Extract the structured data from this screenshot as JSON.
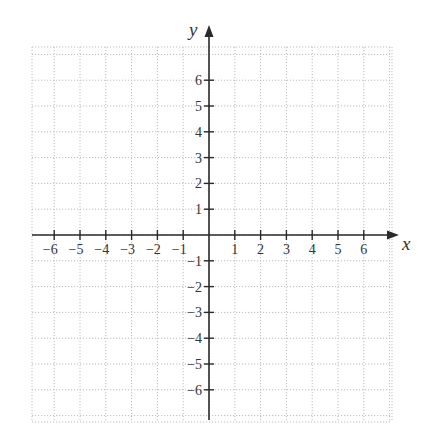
{
  "chart_data": {
    "type": "coordinate-grid",
    "title": "",
    "xlabel": "x",
    "ylabel": "y",
    "xlim": [
      -7,
      7
    ],
    "ylim": [
      -7,
      7
    ],
    "grid": true,
    "grid_style": "dotted",
    "x_ticks": [
      -6,
      -5,
      -4,
      -3,
      -2,
      -1,
      1,
      2,
      3,
      4,
      5,
      6
    ],
    "y_ticks": [
      -6,
      -5,
      -4,
      -3,
      -2,
      -1,
      1,
      2,
      3,
      4,
      5,
      6
    ],
    "x_tick_labels": [
      "−6",
      "−5",
      "−4",
      "−3",
      "−2",
      "−1",
      "1",
      "2",
      "3",
      "4",
      "5",
      "6"
    ],
    "y_tick_labels": [
      "−6",
      "−5",
      "−4",
      "−3",
      "−2",
      "−1",
      "1",
      "2",
      "3",
      "4",
      "5",
      "6"
    ],
    "series": []
  },
  "colors": {
    "axis": "#2a2a2a",
    "grid": "#bdbdbd",
    "background": "#ffffff"
  }
}
